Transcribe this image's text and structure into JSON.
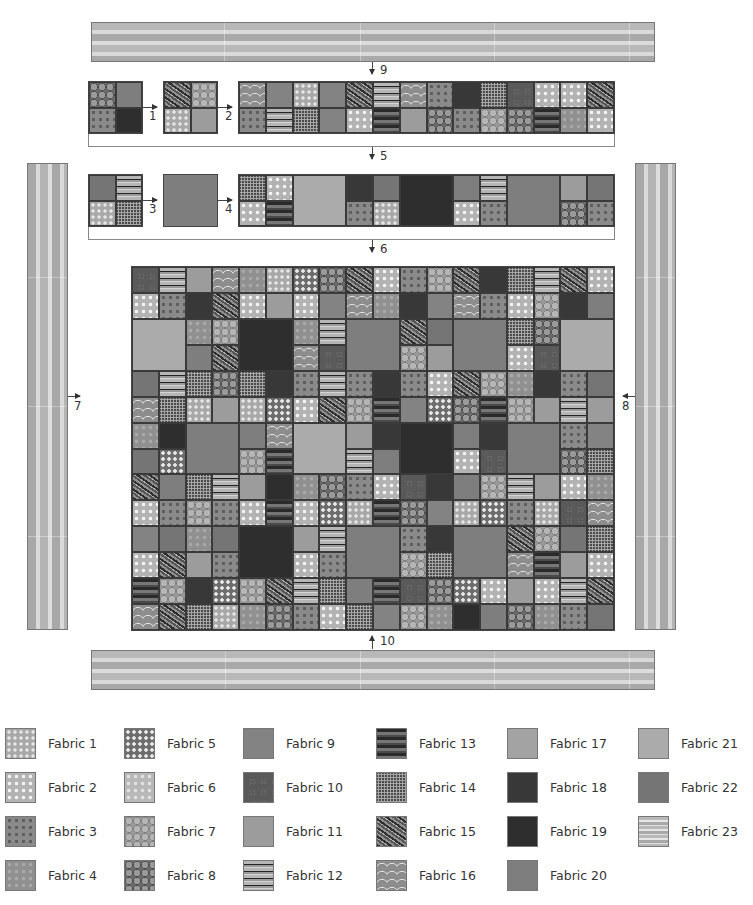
{
  "steps": {
    "s1": "1",
    "s2": "2",
    "s3": "3",
    "s4": "4",
    "s5": "5",
    "s6": "6",
    "s7": "7",
    "s8": "8",
    "s9": "9",
    "s10": "10"
  },
  "step1_blocks": {
    "blockA": [
      [
        "f8",
        "f20"
      ],
      [
        "f3",
        "f19"
      ]
    ],
    "blockB": [
      [
        "f15",
        "f7"
      ],
      [
        "f1",
        "f11"
      ]
    ],
    "strip": [
      [
        "f16",
        "f9",
        "f1",
        "f9",
        "f15",
        "f12",
        "f16",
        "f3",
        "f18",
        "f14",
        "f10",
        "f2",
        "f2",
        "f15"
      ],
      [
        "f3",
        "f12",
        "f14",
        "f9",
        "f2",
        "f13",
        "f11",
        "f8",
        "f3",
        "f7",
        "f8",
        "f13",
        "f4",
        "f2"
      ]
    ]
  },
  "step2_blocks": {
    "blockC": [
      [
        "f22",
        "f12"
      ],
      [
        "f1",
        "f14"
      ]
    ],
    "big": "f20",
    "strip": [
      [
        "f14",
        "f2",
        "BIG:f21",
        "f18",
        "f22",
        "BIG:f19",
        "f20",
        "f12",
        "BIG:f20",
        "f11",
        "f22"
      ],
      [
        "f2",
        "f13",
        "",
        "f3",
        "f1",
        "",
        "f2",
        "f3",
        "",
        "f8",
        "f3"
      ]
    ]
  },
  "quilt": {
    "cols": 18,
    "rows": 14,
    "cells": [
      [
        "f10",
        "f12",
        "f11",
        "f16",
        "f4",
        "f1",
        "f5",
        "f8",
        "f15",
        "f2",
        "f3",
        "f7",
        "f15",
        "f18",
        "f14",
        "f12",
        "f15",
        "f2"
      ],
      [
        "f2",
        "f3",
        "f18",
        "f15",
        "f2",
        "f11",
        "f2",
        "f9",
        "f16",
        "f4",
        "f18",
        "f9",
        "f16",
        "f3",
        "f2",
        "f7",
        "f18",
        "f20"
      ],
      [
        "B:f21",
        "B:f21",
        "f4",
        "f7",
        "B:f19",
        "B:f19",
        "f4",
        "f12",
        "B:f20",
        "B:f20",
        "f15",
        "f22",
        "B:f20",
        "B:f20",
        "f14",
        "f8",
        "B:f21",
        "B:f21"
      ],
      [
        "B:f21",
        "B:f21",
        "f20",
        "f15",
        "B:f19",
        "B:f19",
        "f16",
        "f10",
        "B:f20",
        "B:f20",
        "f7",
        "f11",
        "B:f20",
        "B:f20",
        "f2",
        "f10",
        "B:f21",
        "B:f21"
      ],
      [
        "f22",
        "f12",
        "f14",
        "f8",
        "f14",
        "f18",
        "f3",
        "f12",
        "f3",
        "f18",
        "f3",
        "f2",
        "f15",
        "f7",
        "f4",
        "f18",
        "f3",
        "f22"
      ],
      [
        "f16",
        "f14",
        "f1",
        "f11",
        "f1",
        "f5",
        "f2",
        "f15",
        "f7",
        "f13",
        "f9",
        "f5",
        "f8",
        "f13",
        "f7",
        "f11",
        "f12",
        "f11"
      ],
      [
        "f4",
        "f19",
        "B:f20",
        "B:f20",
        "f20",
        "f16",
        "B:f21",
        "B:f21",
        "f11",
        "f18",
        "B:f19",
        "B:f19",
        "f20",
        "f18",
        "B:f20",
        "B:f20",
        "f3",
        "f9"
      ],
      [
        "f22",
        "f5",
        "B:f20",
        "B:f20",
        "f7",
        "f13",
        "B:f21",
        "B:f21",
        "f12",
        "f20",
        "B:f19",
        "B:f19",
        "f2",
        "f10",
        "B:f20",
        "B:f20",
        "f8",
        "f14"
      ],
      [
        "f15",
        "f20",
        "f14",
        "f12",
        "f11",
        "f19",
        "f4",
        "f8",
        "f3",
        "f2",
        "f10",
        "f18",
        "f20",
        "f7",
        "f12",
        "f11",
        "f2",
        "f4"
      ],
      [
        "f2",
        "f3",
        "f7",
        "f3",
        "f2",
        "f13",
        "f2",
        "f5",
        "f1",
        "f13",
        "f8",
        "f9",
        "f1",
        "f5",
        "f3",
        "f1",
        "f10",
        "f16"
      ],
      [
        "f9",
        "f22",
        "f4",
        "f22",
        "B:f19",
        "B:f19",
        "f11",
        "f12",
        "B:f20",
        "B:f20",
        "f3",
        "f18",
        "B:f20",
        "B:f20",
        "f15",
        "f7",
        "f22",
        "f14"
      ],
      [
        "f2",
        "f15",
        "f11",
        "f3",
        "B:f19",
        "B:f19",
        "f2",
        "f3",
        "B:f20",
        "B:f20",
        "f7",
        "f14",
        "B:f20",
        "B:f20",
        "f16",
        "f13",
        "f11",
        "f2"
      ],
      [
        "f13",
        "f7",
        "f18",
        "f5",
        "f7",
        "f15",
        "f12",
        "f14",
        "f20",
        "f13",
        "f10",
        "f8",
        "f5",
        "f2",
        "f11",
        "f2",
        "f12",
        "f15"
      ],
      [
        "f16",
        "f15",
        "f14",
        "f1",
        "f4",
        "f8",
        "f3",
        "f2",
        "f14",
        "f9",
        "f7",
        "f4",
        "f19",
        "f20",
        "f8",
        "f4",
        "f3",
        "f22"
      ]
    ]
  },
  "legend": {
    "items": [
      {
        "id": "f1",
        "label": "Fabric 1"
      },
      {
        "id": "f2",
        "label": "Fabric 2"
      },
      {
        "id": "f3",
        "label": "Fabric 3"
      },
      {
        "id": "f4",
        "label": "Fabric 4"
      },
      {
        "id": "f5",
        "label": "Fabric 5"
      },
      {
        "id": "f6",
        "label": "Fabric 6"
      },
      {
        "id": "f7",
        "label": "Fabric 7"
      },
      {
        "id": "f8",
        "label": "Fabric 8"
      },
      {
        "id": "f9",
        "label": "Fabric 9"
      },
      {
        "id": "f10",
        "label": "Fabric 10"
      },
      {
        "id": "f11",
        "label": "Fabric 11"
      },
      {
        "id": "f12",
        "label": "Fabric 12"
      },
      {
        "id": "f13",
        "label": "Fabric 13"
      },
      {
        "id": "f14",
        "label": "Fabric 14"
      },
      {
        "id": "f15",
        "label": "Fabric 15"
      },
      {
        "id": "f16",
        "label": "Fabric 16"
      },
      {
        "id": "f17",
        "label": "Fabric 17"
      },
      {
        "id": "f18",
        "label": "Fabric 18"
      },
      {
        "id": "f19",
        "label": "Fabric 19"
      },
      {
        "id": "f20",
        "label": "Fabric 20"
      },
      {
        "id": "f21",
        "label": "Fabric 21"
      },
      {
        "id": "f22",
        "label": "Fabric 22"
      },
      {
        "id": "f23",
        "label": "Fabric 23"
      }
    ]
  }
}
